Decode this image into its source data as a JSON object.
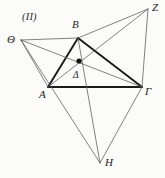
{
  "figure": {
    "caption": "(II)",
    "canvas": {
      "width": 165,
      "height": 178
    },
    "background_color": "#fbfbfa",
    "stroke_color_thin": "#5a5a5a",
    "stroke_color_bold": "#1a1a1a",
    "point_color": "#111111"
  },
  "points": {
    "Theta": {
      "label": "Θ",
      "x": 21,
      "y": 40,
      "label_x": 7,
      "label_y": 34
    },
    "B": {
      "label": "B",
      "x": 78,
      "y": 38,
      "label_x": 72,
      "label_y": 19
    },
    "Z": {
      "label": "Z",
      "x": 148,
      "y": 9,
      "label_x": 152,
      "label_y": 2
    },
    "A": {
      "label": "A",
      "x": 48,
      "y": 87,
      "label_x": 39,
      "label_y": 89
    },
    "Gamma": {
      "label": "Γ",
      "x": 142,
      "y": 87,
      "label_x": 145,
      "label_y": 86
    },
    "Delta": {
      "label": "Δ",
      "x": 79,
      "y": 61,
      "label_x": 73,
      "label_y": 71
    },
    "H": {
      "label": "H",
      "x": 100,
      "y": 163,
      "label_x": 105,
      "label_y": 157
    }
  },
  "segments": [
    {
      "name": "A-B",
      "from": "A",
      "to": "B",
      "weight": "bold"
    },
    {
      "name": "B-Gamma",
      "from": "B",
      "to": "Gamma",
      "weight": "bold"
    },
    {
      "name": "A-Gamma",
      "from": "A",
      "to": "Gamma",
      "weight": "bold"
    },
    {
      "name": "Theta-B",
      "from": "Theta",
      "to": "B",
      "weight": "thin"
    },
    {
      "name": "Theta-A",
      "from": "Theta",
      "to": "A",
      "weight": "thin"
    },
    {
      "name": "Theta-Gamma",
      "from": "Theta",
      "to": "Gamma",
      "weight": "thin"
    },
    {
      "name": "Theta-H",
      "from": "Theta",
      "to": "H",
      "weight": "thin"
    },
    {
      "name": "Z-B",
      "from": "Z",
      "to": "B",
      "weight": "thin"
    },
    {
      "name": "Z-Gamma",
      "from": "Z",
      "to": "Gamma",
      "weight": "thin"
    },
    {
      "name": "Z-A",
      "from": "Z",
      "to": "A",
      "weight": "thin"
    },
    {
      "name": "H-B",
      "from": "H",
      "to": "B",
      "weight": "thin"
    },
    {
      "name": "H-Gamma",
      "from": "H",
      "to": "Gamma",
      "weight": "thin"
    }
  ],
  "marked_points": [
    {
      "name": "centroid-dot",
      "at": "Delta",
      "radius": 2.6
    }
  ]
}
